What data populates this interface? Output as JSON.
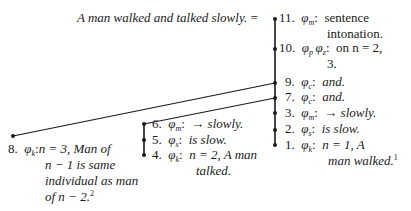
{
  "diagram": {
    "root_sentence": "A man walked and talked slowly.",
    "root_equals": "=",
    "nodes": [
      {
        "num": "11.",
        "phi": "φ",
        "sub": "m",
        "sep": ":",
        "text": "sentence",
        "text2": "intonation.",
        "italic": false
      },
      {
        "num": "10.",
        "phi": "φ",
        "sub": "p",
        "phi2": "φ",
        "sub2": "z",
        "sep": ":",
        "text": "on n = 2,",
        "text2": "3.",
        "italic": false
      },
      {
        "num": "9.",
        "phi": "φ",
        "sub": "c",
        "sep": ":",
        "text": "and.",
        "italic": true
      },
      {
        "num": "7.",
        "phi": "φ",
        "sub": "c",
        "sep": ":",
        "text": "and.",
        "italic": true
      },
      {
        "num": "3.",
        "phi": "φ",
        "sub": "m",
        "sep": ":",
        "text": "→ slowly.",
        "italic": true
      },
      {
        "num": "2.",
        "phi": "φ",
        "sub": "s",
        "sep": ":",
        "text": "is slow.",
        "italic": true
      },
      {
        "num": "1.",
        "phi": "φ",
        "sub": "k",
        "sep": ":",
        "text": "n = 1, A",
        "text2": "man walked.",
        "footnote": "1",
        "italic": true
      },
      {
        "num": "6.",
        "phi": "φ",
        "sub": "m",
        "sep": ":",
        "text": "→ slowly.",
        "italic": true
      },
      {
        "num": "5.",
        "phi": "φ",
        "sub": "s",
        "sep": ":",
        "text": "is slow.",
        "italic": true
      },
      {
        "num": "4.",
        "phi": "φ",
        "sub": "k",
        "sep": ":",
        "text": "n = 2, A man",
        "text2": "talked.",
        "italic": true
      },
      {
        "num": "8.",
        "phi": "φ",
        "sub": "k",
        "sep": ":",
        "text": "n = 3, Man of",
        "text2": "n − 1 is same",
        "text3": "individual as man",
        "text4": "of n − 2.",
        "footnote": "2",
        "italic": true
      }
    ],
    "line_color": "#1a1a1a"
  }
}
